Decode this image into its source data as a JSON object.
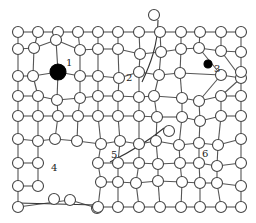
{
  "colors": {
    "bond": "#555555",
    "atom_fill": "#ffffff",
    "atom_stroke": "#444444",
    "impurity": "#000000",
    "background": "#ffffff"
  },
  "labels": [
    {
      "id": "1",
      "text": "1",
      "meaning": "large substitutional impurity atom"
    },
    {
      "id": "2",
      "text": "2",
      "meaning": "edge dislocation / extra half-plane"
    },
    {
      "id": "3",
      "text": "3",
      "meaning": "small interstitial impurity atom"
    },
    {
      "id": "4",
      "text": "4",
      "meaning": "vacancy cluster / void"
    },
    {
      "id": "5",
      "text": "5",
      "meaning": "self-interstitial with dislocation"
    },
    {
      "id": "6",
      "text": "6",
      "meaning": "lattice distortion"
    }
  ],
  "lattice": {
    "rows": 11,
    "cols": 12
  }
}
